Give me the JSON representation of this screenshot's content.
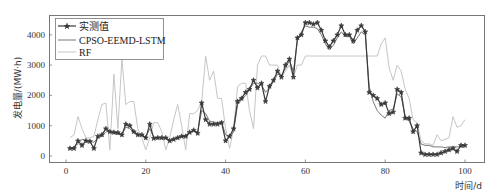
{
  "chart_data": {
    "type": "line",
    "title": "",
    "xlabel": "时间/d",
    "ylabel": "发电量/(MW·h)",
    "xlim": [
      -4,
      105
    ],
    "ylim": [
      -250,
      4600
    ],
    "xticks": [
      0,
      20,
      40,
      60,
      80,
      100
    ],
    "xtick_labels": [
      "0",
      "20",
      "40",
      "60",
      "80",
      "100"
    ],
    "yticks": [
      0,
      1000,
      2000,
      3000,
      4000
    ],
    "ytick_labels": [
      "0",
      "1000",
      "2000",
      "3000",
      "4000"
    ],
    "grid": false,
    "legend_position": "upper left",
    "x": [
      1,
      2,
      3,
      4,
      5,
      6,
      7,
      8,
      9,
      10,
      11,
      12,
      13,
      14,
      15,
      16,
      17,
      18,
      19,
      20,
      21,
      22,
      23,
      24,
      25,
      26,
      27,
      28,
      29,
      30,
      31,
      32,
      33,
      34,
      35,
      36,
      37,
      38,
      39,
      40,
      41,
      42,
      43,
      44,
      45,
      46,
      47,
      48,
      49,
      50,
      51,
      52,
      53,
      54,
      55,
      56,
      57,
      58,
      59,
      60,
      61,
      62,
      63,
      64,
      65,
      66,
      67,
      68,
      69,
      70,
      71,
      72,
      73,
      74,
      75,
      76,
      77,
      78,
      79,
      80,
      81,
      82,
      83,
      84,
      85,
      86,
      87,
      88,
      89,
      90,
      91,
      92,
      93,
      94,
      95,
      96,
      97,
      98,
      99,
      100
    ],
    "series": [
      {
        "name": "实测值",
        "color": "#3a3a3a",
        "marker": "star",
        "values": [
          250,
          250,
          500,
          350,
          500,
          480,
          250,
          650,
          700,
          900,
          800,
          780,
          770,
          700,
          1050,
          1000,
          800,
          700,
          700,
          600,
          1050,
          580,
          600,
          600,
          600,
          500,
          550,
          600,
          650,
          650,
          780,
          850,
          750,
          1750,
          1200,
          1050,
          1050,
          1050,
          1100,
          500,
          650,
          900,
          1800,
          1900,
          2100,
          2200,
          2500,
          2250,
          2400,
          1800,
          2300,
          2500,
          2800,
          2600,
          3000,
          3200,
          2600,
          3900,
          4000,
          4400,
          4400,
          4350,
          4400,
          4150,
          3800,
          3600,
          3800,
          4000,
          4300,
          4000,
          4000,
          3800,
          4150,
          4300,
          4100,
          2100,
          2000,
          1900,
          1700,
          1750,
          1400,
          1450,
          2200,
          2100,
          1250,
          1250,
          800,
          1000,
          100,
          50,
          50,
          50,
          50,
          100,
          150,
          200,
          250,
          150,
          350,
          350
        ]
      },
      {
        "name": "CPSO-EEMD-LSTM",
        "color": "#6a6a6a",
        "values": [
          250,
          300,
          400,
          550,
          520,
          500,
          450,
          600,
          650,
          800,
          820,
          760,
          720,
          700,
          950,
          900,
          780,
          720,
          680,
          620,
          900,
          620,
          620,
          620,
          600,
          520,
          580,
          620,
          660,
          680,
          770,
          820,
          800,
          1500,
          1400,
          1150,
          1120,
          1100,
          1120,
          700,
          620,
          800,
          1700,
          1850,
          2000,
          2200,
          2400,
          2400,
          2350,
          2100,
          2250,
          2450,
          2700,
          2650,
          2900,
          3150,
          2800,
          3800,
          4100,
          4300,
          4250,
          4250,
          4200,
          4000,
          3700,
          3500,
          3650,
          3900,
          4100,
          3950,
          3950,
          3700,
          3900,
          4100,
          4000,
          2300,
          1800,
          1500,
          1350,
          1250,
          1500,
          1550,
          2050,
          1950,
          1300,
          1150,
          900,
          800,
          400,
          350,
          350,
          300,
          300,
          300,
          280,
          300,
          300,
          300,
          300,
          300
        ]
      },
      {
        "name": "RF",
        "color": "#c6c6c6",
        "values": [
          600,
          700,
          1300,
          900,
          600,
          600,
          650,
          1200,
          1700,
          1750,
          200,
          2700,
          900,
          3200,
          1700,
          1800,
          1800,
          900,
          600,
          200,
          600,
          1100,
          1100,
          800,
          200,
          600,
          1200,
          1700,
          1000,
          200,
          1400,
          1400,
          1500,
          1800,
          3300,
          2500,
          2800,
          1900,
          1900,
          900,
          250,
          900,
          2300,
          2400,
          2400,
          1500,
          900,
          3000,
          3300,
          3300,
          3000,
          3000,
          3000,
          2600,
          2800,
          3000,
          2600,
          3000,
          3000,
          3300,
          3300,
          3300,
          3300,
          3300,
          3300,
          3300,
          3300,
          3300,
          3300,
          3300,
          3300,
          3300,
          3300,
          3300,
          3300,
          3300,
          3300,
          3300,
          3700,
          3900,
          2900,
          2500,
          3000,
          2800,
          2200,
          1900,
          1200,
          1100,
          500,
          400,
          400,
          350,
          700,
          500,
          550,
          600,
          1300,
          950,
          1000,
          1200
        ]
      }
    ]
  }
}
